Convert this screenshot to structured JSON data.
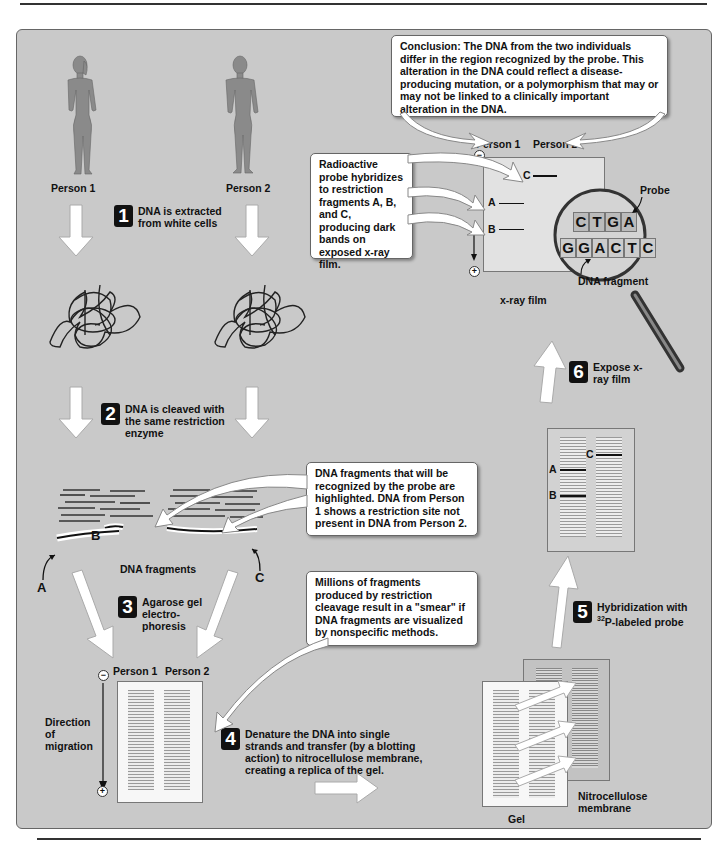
{
  "persons": {
    "person1": "Person 1",
    "person2": "Person 2"
  },
  "steps": [
    {
      "number": "1",
      "text": "DNA is extracted from white cells"
    },
    {
      "number": "2",
      "text": "DNA is cleaved with the same restriction enzyme"
    },
    {
      "number": "3",
      "text": "Agarose gel electro-phoresis"
    },
    {
      "number": "4",
      "text": "Denature the DNA into single strands and transfer (by a blotting action) to nitrocellulose membrane, creating a replica of the gel."
    },
    {
      "number": "5",
      "text_main": "P-labeled probe",
      "text_prefix": "Hybridization with",
      "superscript": "32"
    },
    {
      "number": "6",
      "text": "Expose x-ray film"
    }
  ],
  "callouts": {
    "conclusion": "Conclusion: The DNA from the two individuals differ in the region recognized by the probe. This alteration in the DNA could reflect a disease-producing mutation, or a polymorphism that may or may not be linked to a clinically important alteration in the DNA.",
    "probe_hybridizes": "Radioactive probe hybridizes to restriction fragments A, B, and C, producing dark bands on exposed x-ray film.",
    "fragments_highlighted": "DNA fragments that will be recognized by the probe are highlighted. DNA from Person 1 shows a restriction site not present in DNA from Person 2.",
    "smear": "Millions of fragments produced by restriction cleavage result in a \"smear\" if DNA fragments are visualized by nonspecific methods."
  },
  "labels": {
    "dna_fragments": "DNA fragments",
    "fragment_a": "A",
    "fragment_b": "B",
    "fragment_c": "C",
    "direction_of_migration": "Direction of migration",
    "gel": "Gel",
    "nitrocellulose_membrane": "Nitrocellulose membrane",
    "xray_film": "x-ray film",
    "probe": "Probe",
    "dna_fragment": "DNA fragment",
    "minus": "−",
    "plus": "+"
  },
  "magnifier": {
    "probe_sequence": [
      "C",
      "T",
      "G",
      "A"
    ],
    "fragment_sequence": [
      "G",
      "G",
      "A",
      "C",
      "T",
      "C"
    ]
  },
  "colors": {
    "background_panel": "#c9c9c9",
    "badge": "#111111",
    "callout_fill": "#ffffff",
    "figure_gray": "#8a8a8a"
  }
}
